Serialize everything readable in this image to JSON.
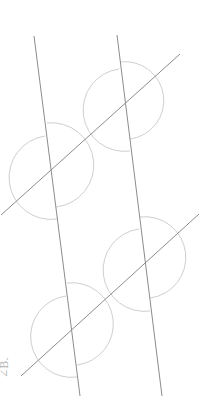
{
  "diagram": {
    "colors": {
      "line": "#8c8c8c",
      "arc": "#cfcfcf",
      "label": "#b8b8b8",
      "background": "#ffffff"
    },
    "label": "∠B.",
    "lines": [
      {
        "id": "line-a",
        "x1": 34,
        "y1": 36,
        "x2": 80,
        "y2": 396
      },
      {
        "id": "line-b",
        "x1": 117,
        "y1": 35,
        "x2": 162,
        "y2": 396
      },
      {
        "id": "diagonal-1",
        "x1": 1,
        "y1": 215,
        "x2": 180,
        "y2": 54
      },
      {
        "id": "diagonal-2",
        "x1": 21,
        "y1": 376,
        "x2": 199,
        "y2": 214
      }
    ],
    "arcs": [
      {
        "id": "arc-ur-right",
        "d": "M 120 62 A 36 36 0 1 1 130 139"
      },
      {
        "id": "arc-ur-left",
        "d": "M 119 69 A 37 37 0 1 0 130 151"
      },
      {
        "id": "arc-ul-right",
        "d": "M 47 123 A 39 39 0 1 1 56 207"
      },
      {
        "id": "arc-ul-left",
        "d": "M 45 136 A 38 38 0 1 0 57 219"
      },
      {
        "id": "arc-lr-right",
        "d": "M 140 217 A 37 37 0 1 1 150 298"
      },
      {
        "id": "arc-lr-left",
        "d": "M 139 229 A 37 37 0 1 0 150 311"
      },
      {
        "id": "arc-ll-right",
        "d": "M 67 283 A 37 37 0 1 1 77 365"
      },
      {
        "id": "arc-ll-left",
        "d": "M 66 296 A 37 37 0 1 0 77 377"
      }
    ]
  }
}
